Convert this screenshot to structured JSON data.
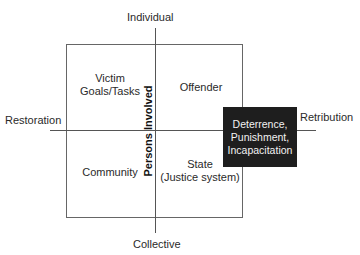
{
  "diagram": {
    "axes": {
      "top": "Individual",
      "bottom": "Collective",
      "left": "Restoration",
      "right": "Retribution",
      "vertical_axis_title": "Persons Involved"
    },
    "quadrants": {
      "top_left": [
        "Victim",
        "Goals/Tasks"
      ],
      "top_right": [
        "Offender"
      ],
      "bottom_left": [
        "Community"
      ],
      "bottom_right": [
        "State",
        "(Justice system)"
      ]
    },
    "highlight_box": {
      "lines": [
        "Deterrence,",
        "Punishment,",
        "Incapacitation"
      ],
      "background": "#1e1e1e",
      "text_color": "#f2f2f2"
    }
  }
}
